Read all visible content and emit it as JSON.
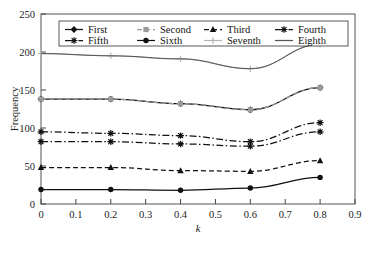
{
  "chart_data": {
    "type": "line",
    "title": "",
    "xlabel": "k",
    "ylabel": "Frequency",
    "xlim": [
      0,
      0.9
    ],
    "ylim": [
      0,
      250
    ],
    "xticks": [
      "0",
      "0.1",
      "0.2",
      "0.3",
      "0.4",
      "0.5",
      "0.6",
      "0.7",
      "0.8",
      "0.9"
    ],
    "yticks": [
      "0",
      "50",
      "100",
      "150",
      "200",
      "250"
    ],
    "grid": false,
    "legend_position": "top-inside",
    "x": [
      0,
      0.2,
      0.4,
      0.6,
      0.8
    ],
    "series": [
      {
        "name": "First",
        "values": [
          138,
          138,
          132,
          124,
          153
        ],
        "marker": "diamond",
        "dash": "solid",
        "color": "#111111"
      },
      {
        "name": "Second",
        "values": [
          138,
          138,
          132,
          124,
          153
        ],
        "marker": "square",
        "dash": "dashed",
        "color": "#9a9a9a"
      },
      {
        "name": "Third",
        "values": [
          48,
          48,
          44,
          43,
          57
        ],
        "marker": "triangle",
        "dash": "dashed",
        "color": "#111111"
      },
      {
        "name": "Fourth",
        "values": [
          95,
          93,
          90,
          82,
          107
        ],
        "marker": "star",
        "dash": "dashdot",
        "color": "#111111"
      },
      {
        "name": "Fifth",
        "values": [
          82,
          82,
          79,
          76,
          95
        ],
        "marker": "star",
        "dash": "dashdot",
        "color": "#111111"
      },
      {
        "name": "Sixth",
        "values": [
          19,
          19,
          18,
          21,
          35
        ],
        "marker": "circle",
        "dash": "solid",
        "color": "#111111"
      },
      {
        "name": "Seventh",
        "values": [
          198,
          195,
          191,
          178,
          210
        ],
        "marker": "plus",
        "dash": "solid",
        "color": "#b5b5b5"
      },
      {
        "name": "Eighth",
        "values": [
          198,
          195,
          191,
          178,
          210
        ],
        "marker": "none",
        "dash": "solid",
        "color": "#555555"
      }
    ],
    "legend": [
      {
        "label": "First",
        "marker": "diamond",
        "dash": "solid",
        "color": "#111111"
      },
      {
        "label": "Second",
        "marker": "square",
        "dash": "dashed",
        "color": "#9a9a9a"
      },
      {
        "label": "Third",
        "marker": "triangle",
        "dash": "dashed",
        "color": "#111111"
      },
      {
        "label": "Fourth",
        "marker": "star",
        "dash": "dashdot",
        "color": "#111111"
      },
      {
        "label": "Fifth",
        "marker": "star",
        "dash": "dashdot",
        "color": "#111111"
      },
      {
        "label": "Sixth",
        "marker": "circle",
        "dash": "solid",
        "color": "#111111"
      },
      {
        "label": "Seventh",
        "marker": "plus",
        "dash": "solid",
        "color": "#b5b5b5"
      },
      {
        "label": "Eighth",
        "marker": "none",
        "dash": "solid",
        "color": "#555555"
      }
    ]
  }
}
